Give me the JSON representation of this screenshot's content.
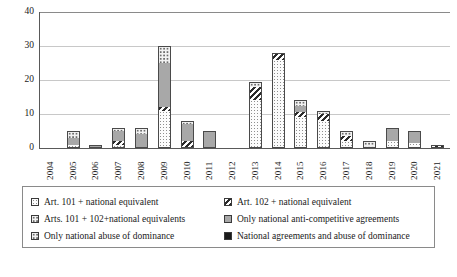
{
  "chart_data": {
    "type": "bar",
    "title": "",
    "xlabel": "",
    "ylabel": "",
    "ylim": [
      0,
      40
    ],
    "yticks": [
      0,
      10,
      20,
      30,
      40
    ],
    "grid": true,
    "stacked": true,
    "legend_position": "bottom",
    "categories": [
      "2004",
      "2005",
      "2006",
      "2007",
      "2008",
      "2009",
      "2010",
      "2011",
      "2012",
      "2013",
      "2014",
      "2015",
      "2016",
      "2017",
      "2018",
      "2019",
      "2020",
      "2021"
    ],
    "series": [
      {
        "name": "Art. 101 + national equivalent",
        "pattern": "p-dots",
        "values": [
          0,
          1,
          0,
          1,
          0,
          11,
          0,
          0,
          0,
          14,
          26,
          9,
          8,
          2,
          0,
          2,
          1.5,
          0
        ]
      },
      {
        "name": "Art. 102 + national equivalent",
        "pattern": "p-diag",
        "values": [
          0,
          0,
          0,
          1,
          0,
          1,
          2,
          0,
          0,
          4,
          2,
          1.5,
          2,
          1.5,
          0,
          0,
          0,
          1
        ]
      },
      {
        "name": "Arts. 101 + 102+national equivalents",
        "pattern": "p-circles",
        "values": [
          0,
          0,
          0,
          0,
          0,
          0,
          0,
          0,
          0,
          0,
          0,
          0,
          0,
          0,
          0.5,
          0,
          0,
          0
        ]
      },
      {
        "name": "Only national anti-competitive agreements",
        "pattern": "p-solidgray",
        "values": [
          0,
          2,
          1,
          3,
          4,
          13,
          5,
          5,
          0,
          0,
          0,
          2,
          0,
          0,
          0,
          4,
          3.5,
          0
        ]
      },
      {
        "name": "Only national abuse of dominance",
        "pattern": "p-circles",
        "values": [
          0,
          2,
          0,
          1,
          2,
          5,
          1,
          0,
          0,
          1.5,
          0,
          1.5,
          1,
          1.5,
          1.5,
          0,
          0,
          0
        ]
      },
      {
        "name": "National agreements  and abuse of dominance",
        "pattern": "p-black",
        "values": [
          0,
          0,
          0,
          0,
          0,
          0,
          0,
          0,
          0,
          0,
          0,
          0,
          0,
          0,
          0,
          0,
          0,
          0
        ]
      }
    ],
    "bar_totals": [
      0,
      5,
      1,
      6,
      6,
      30,
      8,
      5,
      0,
      19.5,
      28,
      14,
      11,
      5,
      2,
      6,
      5,
      1
    ]
  },
  "legend": {
    "entries": [
      {
        "label": "Art. 101 + national equivalent",
        "swatch": "p-dots"
      },
      {
        "label": "Art. 102 + national equivalent",
        "swatch": "p-diag"
      },
      {
        "label": "Arts. 101 + 102+national equivalents",
        "swatch": "p-circles"
      },
      {
        "label": "Only national anti-competitive agreements",
        "swatch": "p-solidgray"
      },
      {
        "label": "Only national abuse of dominance",
        "swatch": "p-circles"
      },
      {
        "label": "National agreements  and abuse of dominance",
        "swatch": "p-black"
      }
    ]
  },
  "colors": {
    "gray_fill": "#a8a8a8",
    "black_fill": "#1b1b1b",
    "gridline": "#c8c8c8",
    "axis": "#595959",
    "background": "#ffffff"
  }
}
